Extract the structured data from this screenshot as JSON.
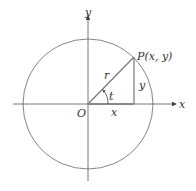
{
  "diagram": {
    "type": "unit-circle-trig",
    "labels": {
      "y_axis": "y",
      "x_axis": "x",
      "origin": "O",
      "point": "P(x,  y)",
      "radius": "r",
      "angle": "t",
      "opposite": "y",
      "adjacent": "x"
    },
    "colors": {
      "lines": "#555555",
      "triangle_base": "#777777",
      "text": "#333333"
    }
  }
}
